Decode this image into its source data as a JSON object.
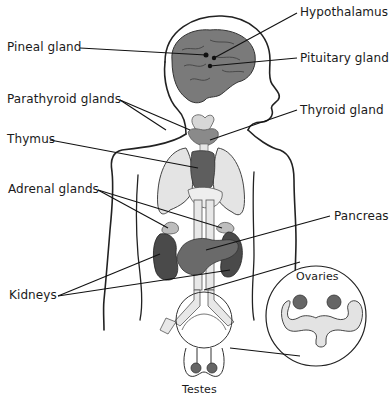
{
  "diagram": {
    "colors": {
      "outline": "#222222",
      "gland_dark": "#5a5a5a",
      "gland_mid": "#7c7c7c",
      "organ_light": "#e3e3e3",
      "thymus_light": "#cfcfcf",
      "background": "#ffffff"
    },
    "labels": [
      {
        "id": "hypothalamus",
        "text": "Hypothalamus"
      },
      {
        "id": "pineal",
        "text": "Pineal gland"
      },
      {
        "id": "pituitary",
        "text": "Pituitary gland"
      },
      {
        "id": "parathyroid",
        "text": "Parathyroid glands"
      },
      {
        "id": "thyroid",
        "text": "Thyroid gland"
      },
      {
        "id": "thymus",
        "text": "Thymus"
      },
      {
        "id": "adrenal",
        "text": "Adrenal glands"
      },
      {
        "id": "pancreas",
        "text": "Pancreas"
      },
      {
        "id": "kidneys",
        "text": "Kidneys"
      },
      {
        "id": "ovaries",
        "text": "Ovaries"
      },
      {
        "id": "testes",
        "text": "Testes"
      }
    ]
  }
}
